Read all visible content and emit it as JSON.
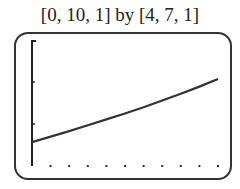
{
  "header": {
    "window_label": "[0, 10, 1] by [4, 7, 1]"
  },
  "chart_data": {
    "type": "line",
    "title": "[0, 10, 1] by [4, 7, 1]",
    "xlabel": "",
    "ylabel": "",
    "xlim": [
      0,
      10
    ],
    "ylim": [
      4,
      7
    ],
    "xscale": 1,
    "yscale": 1,
    "grid": false,
    "x_ticks": [
      1,
      2,
      3,
      4,
      5,
      6,
      7,
      8,
      9,
      10
    ],
    "y_ticks": [
      5,
      6
    ],
    "series": [
      {
        "name": "f(x)",
        "x": [
          0,
          1,
          2,
          3,
          4,
          5,
          6,
          7,
          8,
          9,
          10
        ],
        "values": [
          4.57,
          4.7,
          4.83,
          4.97,
          5.11,
          5.25,
          5.4,
          5.56,
          5.72,
          5.89,
          6.07
        ]
      }
    ]
  }
}
